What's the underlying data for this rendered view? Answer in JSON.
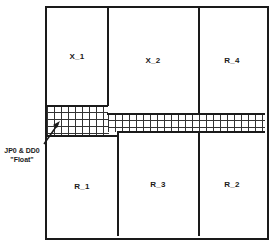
{
  "diagram": {
    "regions": {
      "top": [
        {
          "id": "X_1",
          "label": "X_1"
        },
        {
          "id": "X_2",
          "label": "X_2"
        },
        {
          "id": "R_4",
          "label": "R_4"
        }
      ],
      "bottom": [
        {
          "id": "R_1",
          "label": "R_1"
        },
        {
          "id": "R_3",
          "label": "R_3"
        },
        {
          "id": "R_2",
          "label": "R_2"
        }
      ]
    },
    "float_region": {
      "annotation_line1": "JP0 & DD0",
      "annotation_line2": "\"Float\""
    },
    "colors": {
      "line": "#1a1a1a",
      "background": "#ffffff"
    }
  }
}
